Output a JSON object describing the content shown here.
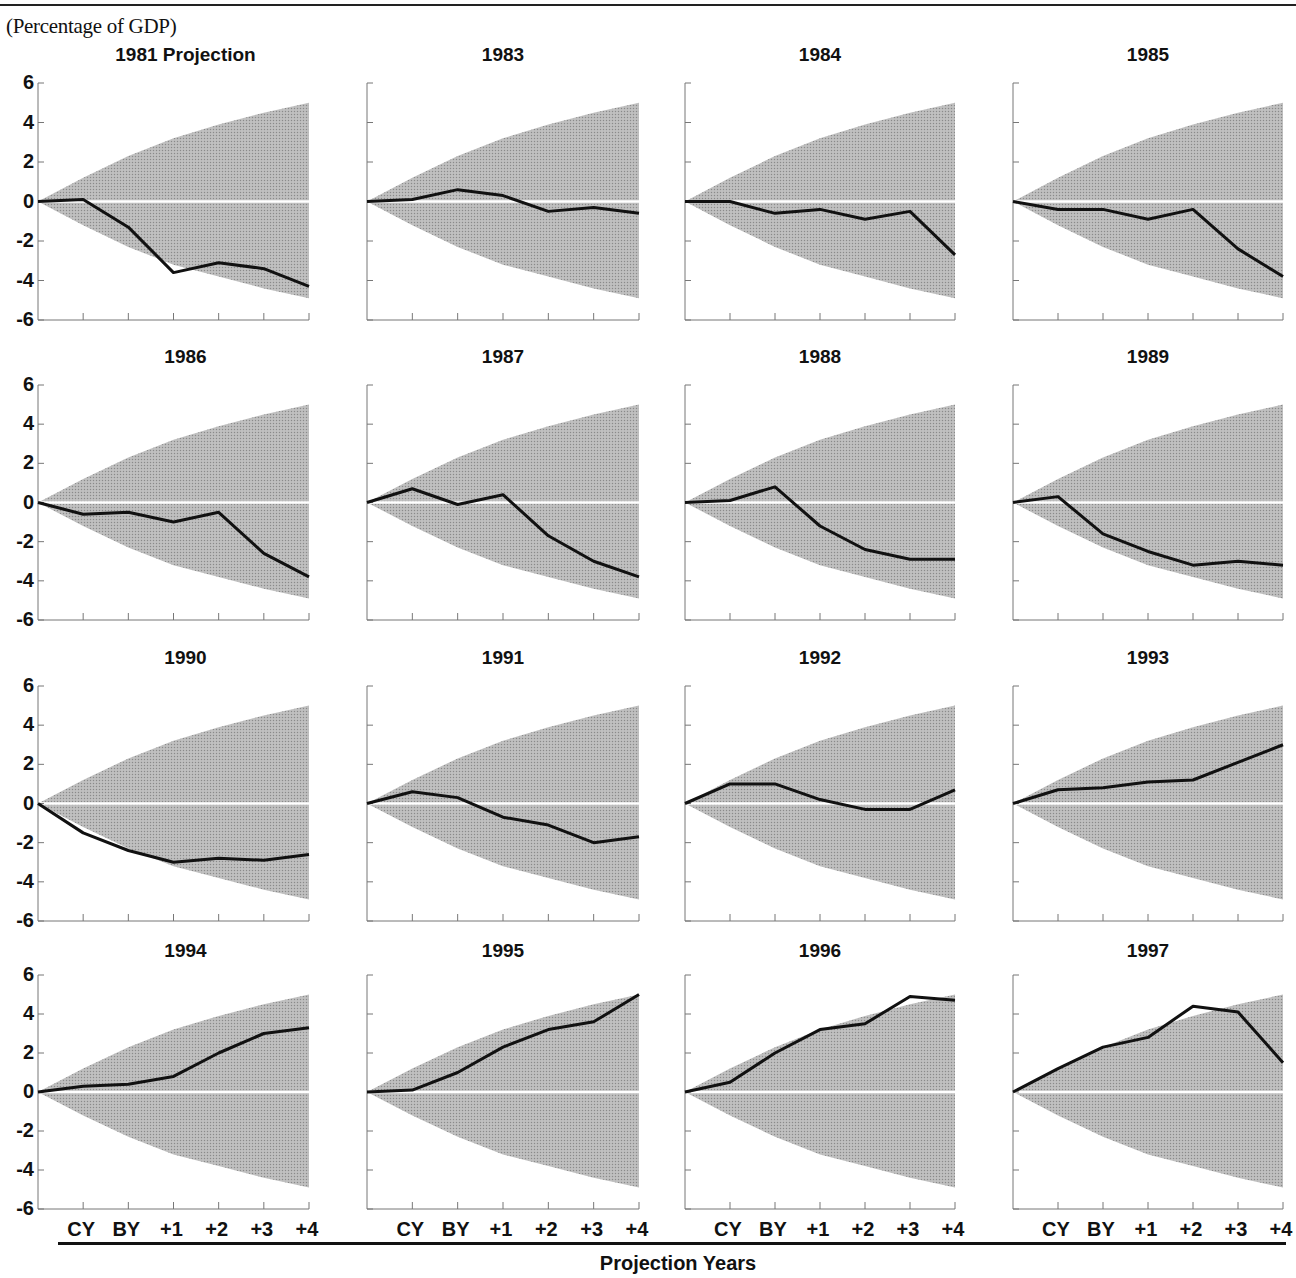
{
  "header": {
    "unit_label": "(Percentage of GDP)"
  },
  "footer": {
    "x_axis_title": "Projection Years"
  },
  "colors": {
    "band": "#b9b9b9",
    "line": "#111111",
    "zero_line": "#ffffff",
    "axis": "#777777"
  },
  "chart_data": {
    "type": "line",
    "title": "",
    "ylabel": "(Percentage of GDP)",
    "xlabel": "Projection Years",
    "ylim": [
      -6,
      6
    ],
    "yticks": [
      "6",
      "4",
      "2",
      "0",
      "-2",
      "-4",
      "-6"
    ],
    "x": [
      "start",
      "CY",
      "BY",
      "+1",
      "+2",
      "+3",
      "+4"
    ],
    "x_tick_labels": [
      "CY",
      "BY",
      "+1",
      "+2",
      "+3",
      "+4"
    ],
    "grid": false,
    "band": {
      "name": "Uncertainty range (shaded)",
      "upper": [
        0,
        1.2,
        2.3,
        3.2,
        3.9,
        4.5,
        5.0
      ],
      "lower": [
        0,
        -1.2,
        -2.3,
        -3.2,
        -3.8,
        -4.4,
        -4.9
      ]
    },
    "panels": [
      {
        "title": "1981 Projection",
        "values": [
          0,
          0.1,
          -1.3,
          -3.6,
          -3.1,
          -3.4,
          -4.3
        ]
      },
      {
        "title": "1983",
        "values": [
          0,
          0.1,
          0.6,
          0.3,
          -0.5,
          -0.3,
          -0.6
        ]
      },
      {
        "title": "1984",
        "values": [
          0,
          0.0,
          -0.6,
          -0.4,
          -0.9,
          -0.5,
          -2.7
        ]
      },
      {
        "title": "1985",
        "values": [
          0,
          -0.4,
          -0.4,
          -0.9,
          -0.4,
          -2.4,
          -3.8
        ]
      },
      {
        "title": "1986",
        "values": [
          0,
          -0.6,
          -0.5,
          -1.0,
          -0.5,
          -2.6,
          -3.8
        ]
      },
      {
        "title": "1987",
        "values": [
          0,
          0.7,
          -0.1,
          0.4,
          -1.7,
          -3.0,
          -3.8
        ]
      },
      {
        "title": "1988",
        "values": [
          0,
          0.1,
          0.8,
          -1.2,
          -2.4,
          -2.9,
          -2.9
        ]
      },
      {
        "title": "1989",
        "values": [
          0,
          0.3,
          -1.6,
          -2.5,
          -3.2,
          -3.0,
          -3.2
        ]
      },
      {
        "title": "1990",
        "values": [
          0,
          -1.5,
          -2.4,
          -3.0,
          -2.8,
          -2.9,
          -2.6
        ]
      },
      {
        "title": "1991",
        "values": [
          0,
          0.6,
          0.3,
          -0.7,
          -1.1,
          -2.0,
          -1.7
        ]
      },
      {
        "title": "1992",
        "values": [
          0,
          1.0,
          1.0,
          0.2,
          -0.3,
          -0.3,
          0.7
        ]
      },
      {
        "title": "1993",
        "values": [
          0,
          0.7,
          0.8,
          1.1,
          1.2,
          2.1,
          3.0
        ]
      },
      {
        "title": "1994",
        "values": [
          0,
          0.3,
          0.4,
          0.8,
          2.0,
          3.0,
          3.3
        ]
      },
      {
        "title": "1995",
        "values": [
          0,
          0.1,
          1.0,
          2.3,
          3.2,
          3.6,
          5.0
        ]
      },
      {
        "title": "1996",
        "values": [
          0,
          0.5,
          2.0,
          3.2,
          3.5,
          4.9,
          4.7
        ]
      },
      {
        "title": "1997",
        "values": [
          0,
          1.2,
          2.3,
          2.8,
          4.4,
          4.1,
          1.5
        ]
      }
    ],
    "layout": {
      "rows": 4,
      "cols": 4,
      "y_axis_labels_on": "first column",
      "x_tick_labels_on": "bottom row"
    }
  }
}
